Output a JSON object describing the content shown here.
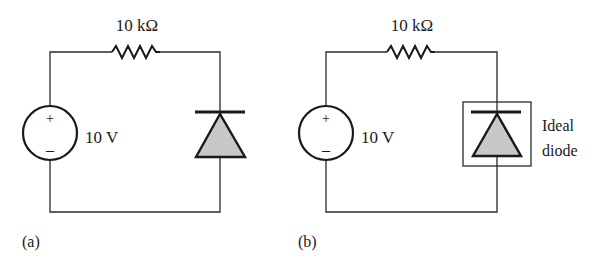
{
  "colors": {
    "wire": "#2a2a2a",
    "diode_fill": "#c8c8c8",
    "text": "#1a1a1a"
  },
  "circuits": [
    {
      "id": "a",
      "caption": "(a)",
      "resistor_label": "10 kΩ",
      "source_label": "10 V",
      "source_plus": "+",
      "source_minus": "–",
      "diode_label": ""
    },
    {
      "id": "b",
      "caption": "(b)",
      "resistor_label": "10 kΩ",
      "source_label": "10 V",
      "source_plus": "+",
      "source_minus": "–",
      "diode_label_line1": "Ideal",
      "diode_label_line2": "diode"
    }
  ]
}
